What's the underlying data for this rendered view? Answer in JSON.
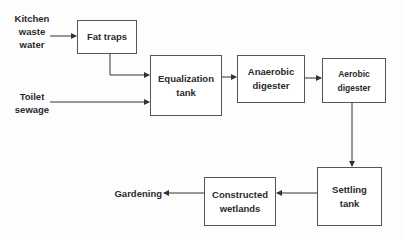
{
  "diagram": {
    "type": "process-flow",
    "inputs": [
      {
        "id": "kitchen",
        "label_lines": [
          "Kitchen",
          "waste",
          "water"
        ]
      },
      {
        "id": "toilet",
        "label_lines": [
          "Toilet",
          "sewage"
        ]
      }
    ],
    "nodes": [
      {
        "id": "fat_traps",
        "label": "Fat traps"
      },
      {
        "id": "equalization",
        "label_lines": [
          "Equalization",
          "tank"
        ]
      },
      {
        "id": "anaerobic",
        "label_lines": [
          "Anaerobic",
          "digester"
        ]
      },
      {
        "id": "aerobic",
        "label_lines": [
          "Aerobic",
          "digester"
        ]
      },
      {
        "id": "settling",
        "label_lines": [
          "Settling",
          "tank"
        ]
      },
      {
        "id": "wetlands",
        "label_lines": [
          "Constructed",
          "wetlands"
        ]
      }
    ],
    "output": {
      "id": "gardening",
      "label": "Gardening"
    },
    "edges": [
      [
        "kitchen",
        "fat_traps"
      ],
      [
        "fat_traps",
        "equalization"
      ],
      [
        "toilet",
        "equalization"
      ],
      [
        "equalization",
        "anaerobic"
      ],
      [
        "anaerobic",
        "aerobic"
      ],
      [
        "aerobic",
        "settling"
      ],
      [
        "settling",
        "wetlands"
      ],
      [
        "wetlands",
        "gardening"
      ]
    ]
  },
  "colors": {
    "line": "#333333",
    "box_border": "#555555",
    "text": "#2a2a2a",
    "background": "#fdfdfd"
  }
}
